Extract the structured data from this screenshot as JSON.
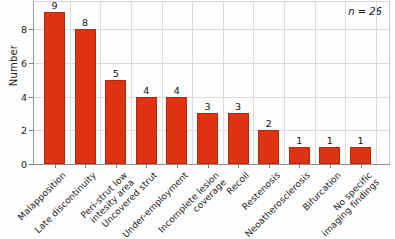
{
  "chart_data": {
    "type": "bar",
    "title": "",
    "subtitle": "",
    "xlabel": "",
    "ylabel": "Number",
    "ylim": [
      0,
      9.6
    ],
    "yticks": [
      0,
      2,
      4,
      6,
      8
    ],
    "grid": true,
    "legend": false,
    "legend_position": "none",
    "bar_color": "#dd3312",
    "bar_edge_color": "#b4280c",
    "annotations": [
      {
        "name": "sample-size",
        "text": "n = 26",
        "position": "top-right",
        "style": "italic"
      }
    ],
    "categories": [
      "Malapposition",
      "Late discontinuity",
      "Peri-strut low\nintesity area",
      "Uncovered strut",
      "Under-employment",
      "Incomplete lesion\ncoverage",
      "Recoil",
      "Restenosis",
      "Neoatherosclerosis",
      "Bifurcation",
      "No specific\nimaging findings"
    ],
    "values": [
      9,
      8,
      5,
      4,
      4,
      3,
      3,
      2,
      1,
      1,
      1
    ],
    "value_labels": [
      "9",
      "8",
      "5",
      "4",
      "4",
      "3",
      "3",
      "2",
      "1",
      "1",
      "1"
    ]
  },
  "axis": {
    "y_title": "Number",
    "y_tick_labels": [
      "0",
      "2",
      "4",
      "6",
      "8"
    ]
  },
  "note": {
    "sample_size": "n = 26"
  }
}
